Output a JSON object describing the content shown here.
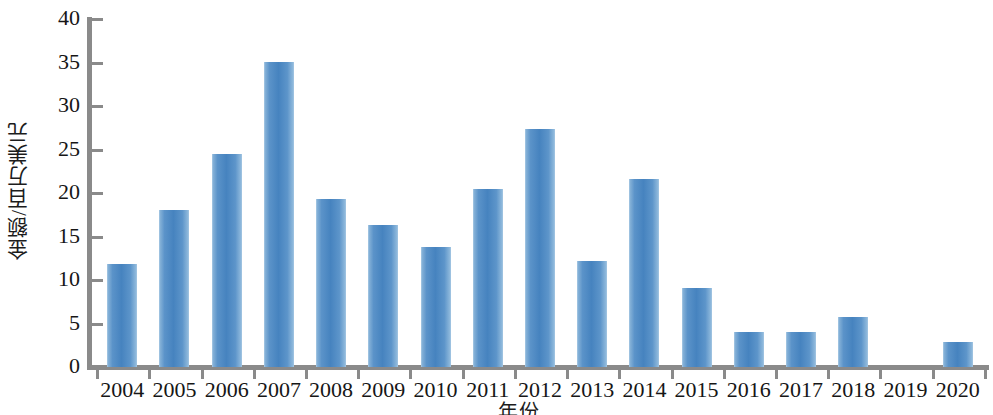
{
  "chart_data": {
    "type": "bar",
    "title": "",
    "subtitle": "",
    "xlabel": "年份",
    "ylabel": "金额/百万美元",
    "categories": [
      "2004",
      "2005",
      "2006",
      "2007",
      "2008",
      "2009",
      "2010",
      "2011",
      "2012",
      "2013",
      "2014",
      "2015",
      "2016",
      "2017",
      "2018",
      "2019",
      "2020"
    ],
    "values": [
      11.8,
      18.1,
      24.5,
      35.1,
      19.3,
      16.3,
      13.8,
      20.5,
      27.3,
      12.2,
      21.6,
      9.1,
      4.0,
      4.0,
      5.8,
      0,
      2.9
    ],
    "series": [
      {
        "name": "金额",
        "values": [
          11.8,
          18.1,
          24.5,
          35.1,
          19.3,
          16.3,
          13.8,
          20.5,
          27.3,
          12.2,
          21.6,
          9.1,
          4.0,
          4.0,
          5.8,
          0,
          2.9
        ]
      }
    ],
    "ylim": [
      0,
      40
    ],
    "ytick_labels": [
      "0",
      "5",
      "10",
      "15",
      "20",
      "25",
      "30",
      "35",
      "40"
    ],
    "ytick_values": [
      0,
      5,
      10,
      15,
      20,
      25,
      30,
      35,
      40
    ],
    "grid": false,
    "legend": false,
    "legend_position": "none",
    "bar_color": "#4683bf",
    "axis_color": "#8a8a8a",
    "background_color": "#ffffff"
  }
}
